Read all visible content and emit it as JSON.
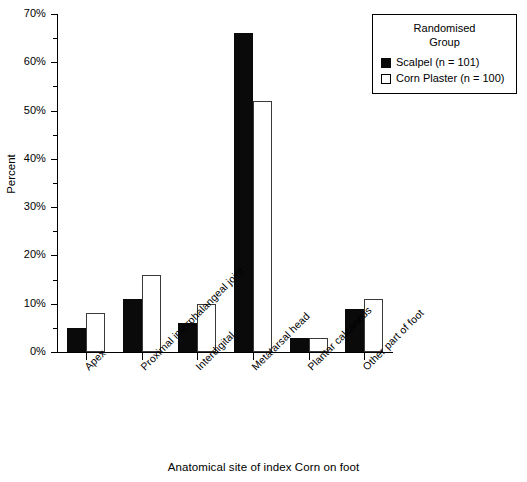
{
  "chart_data": {
    "type": "bar",
    "title": "",
    "xlabel": "Anatomical site of index Corn on foot",
    "ylabel": "Percent",
    "ylim": [
      0,
      70
    ],
    "ytick_labels": [
      "0%",
      "10%",
      "20%",
      "30%",
      "40%",
      "50%",
      "60%",
      "70%"
    ],
    "ytick_values": [
      0,
      10,
      20,
      30,
      40,
      50,
      60,
      70
    ],
    "yminor_values": [
      5,
      15,
      25,
      35,
      45,
      55,
      65
    ],
    "grid": false,
    "legend_position": "top-right",
    "categories": [
      "Apex",
      "Proximal interphalangeal joint",
      "Interdigital",
      "Metatarsal head",
      "Plantar calcaneus",
      "Other part of foot"
    ],
    "series": [
      {
        "name": "Scalpel (n = 101)",
        "color": "#0a0a0a",
        "fill": "solid",
        "values": [
          5,
          11,
          6,
          66,
          3,
          9
        ]
      },
      {
        "name": "Corn Plaster (n = 100)",
        "color": "#ffffff",
        "fill": "hollow",
        "values": [
          8,
          16,
          10,
          52,
          3,
          11
        ]
      }
    ]
  },
  "legend": {
    "title_line1": "Randomised",
    "title_line2": "Group",
    "entries": [
      {
        "label": "Scalpel (n = 101)",
        "swatch": "filled-square-icon"
      },
      {
        "label": "Corn Plaster (n = 100)",
        "swatch": "hollow-square-icon"
      }
    ]
  },
  "axes": {
    "y_title": "Percent",
    "x_title": "Anatomical site of index Corn on foot"
  }
}
